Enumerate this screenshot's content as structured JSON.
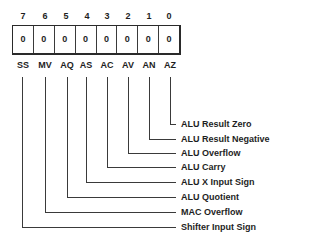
{
  "diagram": {
    "register_bits": [
      {
        "bit": "7",
        "value": "0",
        "mnemonic": "SS",
        "description": "Shifter Input Sign"
      },
      {
        "bit": "6",
        "value": "0",
        "mnemonic": "MV",
        "description": "MAC Overflow"
      },
      {
        "bit": "5",
        "value": "0",
        "mnemonic": "AQ",
        "description": "ALU Quotient"
      },
      {
        "bit": "4",
        "value": "0",
        "mnemonic": "AS",
        "description": "ALU X Input Sign"
      },
      {
        "bit": "3",
        "value": "0",
        "mnemonic": "AC",
        "description": "ALU Carry"
      },
      {
        "bit": "2",
        "value": "0",
        "mnemonic": "AV",
        "description": "ALU Overflow"
      },
      {
        "bit": "1",
        "value": "0",
        "mnemonic": "AN",
        "description": "ALU Result Negative"
      },
      {
        "bit": "0",
        "value": "0",
        "mnemonic": "AZ",
        "description": "ALU Result Zero"
      }
    ],
    "colors": {
      "line": "#3a3a3a",
      "text": "#1e1e1e",
      "background": "#ffffff"
    }
  }
}
